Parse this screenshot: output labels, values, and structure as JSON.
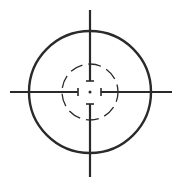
{
  "icon": {
    "name": "crosshair-target",
    "stroke_color": "#2a2a2a",
    "background": "#ffffff",
    "center": [
      90,
      92
    ],
    "outer_circle_radius": 61,
    "inner_dashed_circle_radius": 28,
    "center_dot_radius": 1.5
  }
}
